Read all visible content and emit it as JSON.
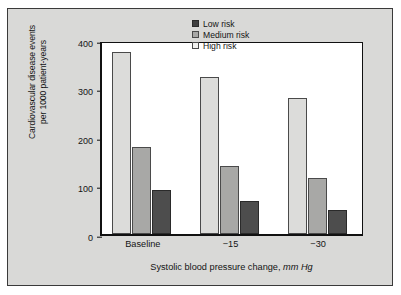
{
  "chart_data": {
    "type": "bar",
    "title": "",
    "subtitle": "",
    "xlabel": "Systolic blood pressure change, mm Hg",
    "xlabel_plain": "Systolic blood pressure change,",
    "xlabel_unit": "mm Hg",
    "ylabel": "Cardiovascular disease events per 1000 patient-years",
    "ylabel_line1": "Cardiovascular disease events",
    "ylabel_line2": "per 1000 patient-years",
    "categories": [
      "Baseline",
      "−15",
      "−30"
    ],
    "series": [
      {
        "name": "Low risk",
        "key": "low",
        "color": "#4d4d4d",
        "values": [
          91,
          68,
          49
        ]
      },
      {
        "name": "Medium risk",
        "key": "medium",
        "color": "#a8a8a6",
        "values": [
          180,
          140,
          115
        ]
      },
      {
        "name": "High risk",
        "key": "high",
        "color": "#dcdcda",
        "values": [
          376,
          323,
          280
        ]
      }
    ],
    "yticks": [
      0,
      100,
      200,
      300,
      400
    ],
    "ylim": [
      0,
      400
    ],
    "grid": false,
    "legend_position": "top-right",
    "legend_order": [
      "Low risk",
      "Medium risk",
      "High risk"
    ],
    "bar_order_in_group": [
      "High risk",
      "Medium risk",
      "Low risk"
    ]
  },
  "legend": {
    "items": [
      {
        "label": "Low risk",
        "key": "low"
      },
      {
        "label": "Medium risk",
        "key": "medium"
      },
      {
        "label": "High risk",
        "key": "high"
      }
    ]
  },
  "colors": {
    "panel_background": "#d9d9d7",
    "plot_background": "#ffffff",
    "axis": "#111111",
    "low_risk": "#4d4d4d",
    "medium_risk": "#a8a8a6",
    "high_risk": "#dcdcda"
  }
}
